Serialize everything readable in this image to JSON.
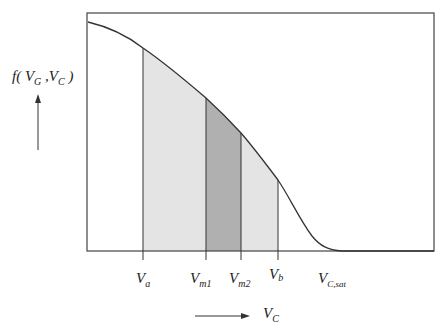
{
  "diagram": {
    "y_axis_label": {
      "main": "f( V",
      "sub1": "G",
      "mid": " ,V",
      "sub2": "C",
      "end": " )"
    },
    "x_axis_label": {
      "main": "V",
      "sub": "C"
    },
    "markers": [
      {
        "id": "Va",
        "main": "V",
        "sub": "a"
      },
      {
        "id": "Vm1",
        "main": "V",
        "sub": "m1"
      },
      {
        "id": "Vm2",
        "main": "V",
        "sub": "m2"
      },
      {
        "id": "Vb",
        "main": "V",
        "sub": "b"
      },
      {
        "id": "Vcsat",
        "main": "V",
        "sub": "C,sat"
      }
    ],
    "colors": {
      "light_fill": "#e4e4e4",
      "dark_fill": "#b0b0b0",
      "line": "#333333"
    }
  }
}
